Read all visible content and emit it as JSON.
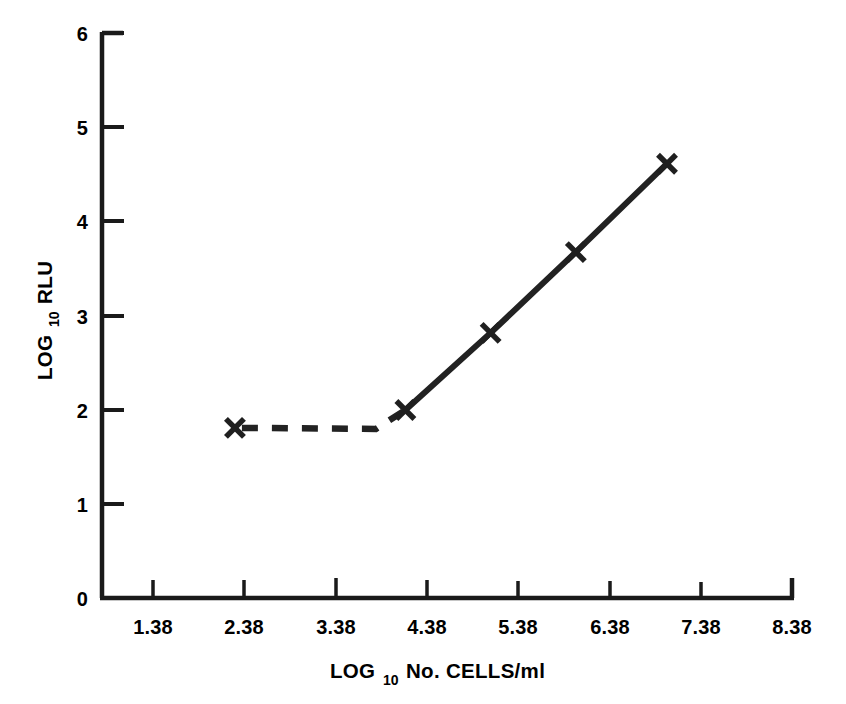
{
  "chart_data": {
    "type": "line",
    "title": "",
    "xlabel": "LOG10 No. CELLS/ml",
    "xlabel_main": "LOG",
    "xlabel_sub": "10",
    "xlabel_rest": "No. CELLS/ml",
    "ylabel": "LOG10 RLU",
    "ylabel_main": "LOG",
    "ylabel_sub": "10",
    "ylabel_rest": "RLU",
    "xlim": [
      0.82,
      8.94
    ],
    "ylim": [
      0,
      6
    ],
    "xticks": [
      "1.38",
      "2.38",
      "3.38",
      "4.38",
      "5.38",
      "6.38",
      "7.38",
      "8.38"
    ],
    "xtick_values": [
      1.38,
      2.38,
      3.38,
      4.38,
      5.38,
      6.38,
      7.38,
      8.38
    ],
    "yticks": [
      "0",
      "1",
      "2",
      "3",
      "4",
      "5",
      "6"
    ],
    "ytick_values": [
      0,
      1,
      2,
      3,
      4,
      5,
      6
    ],
    "grid": false,
    "legend": "none",
    "series": [
      {
        "name": "detection-limit-plateau",
        "style": "dashed",
        "marker": "x",
        "x": [
          2.38,
          4.38
        ],
        "y": [
          1.81,
          2.0
        ]
      },
      {
        "name": "linear-response",
        "style": "solid",
        "marker": "x",
        "x": [
          4.38,
          5.38,
          6.38,
          7.45
        ],
        "y": [
          2.0,
          2.82,
          3.68,
          4.62
        ]
      }
    ],
    "points": [
      {
        "x": 2.38,
        "y": 1.81
      },
      {
        "x": 4.38,
        "y": 2.0
      },
      {
        "x": 5.38,
        "y": 2.82
      },
      {
        "x": 6.38,
        "y": 3.68
      },
      {
        "x": 7.45,
        "y": 4.62
      }
    ],
    "line_color": "#222222",
    "background_color": "#ffffff",
    "axis_color": "#1a1a1a"
  }
}
